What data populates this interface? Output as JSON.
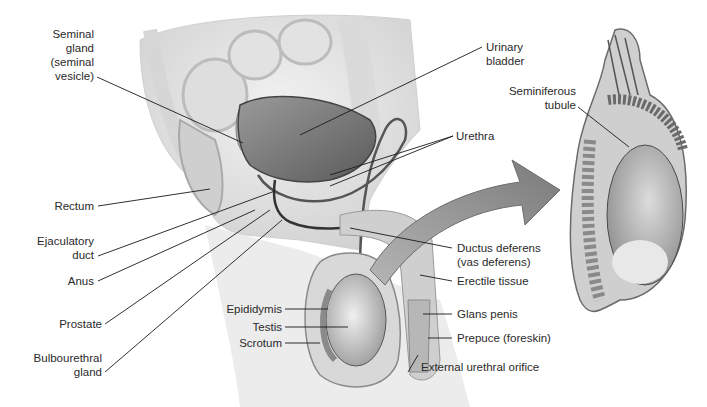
{
  "figure": {
    "type": "anatomical-diagram"
  },
  "labels": {
    "seminal_gland": [
      "Seminal",
      "gland",
      "(seminal",
      "vesicle)"
    ],
    "urinary_bladder": [
      "Urinary",
      "bladder"
    ],
    "urethra": "Urethra",
    "seminiferous_tubule": [
      "Seminiferous",
      "tubule"
    ],
    "rectum": "Rectum",
    "ejaculatory_duct": [
      "Ejaculatory",
      "duct"
    ],
    "anus": "Anus",
    "prostate": "Prostate",
    "bulbourethral_gland": [
      "Bulbourethral",
      "gland"
    ],
    "ductus_deferens": [
      "Ductus deferens",
      "(vas deferens)"
    ],
    "erectile_tissue": "Erectile tissue",
    "epididymis": "Epididymis",
    "testis": "Testis",
    "scrotum": "Scrotum",
    "glans_penis": "Glans penis",
    "prepuce": "Prepuce (foreskin)",
    "external_urethral_orifice": "External urethral orifice"
  },
  "colors": {
    "background": "#ffffff",
    "tissue_light": "#e6e6e6",
    "tissue_mid": "#bdbdbd",
    "tissue_dark": "#6e6e6e",
    "arrow": "#8a8a8a",
    "leader_line": "#1a1a1a"
  }
}
